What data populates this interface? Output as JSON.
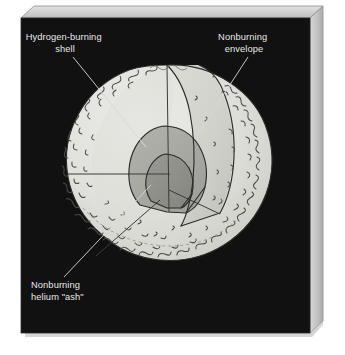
{
  "figure": {
    "background_color": "#ffffff",
    "panel_color": "#111111",
    "bevel_color": "#c9c9c9",
    "bevel_shadow_color": "#9a9a9a",
    "label_color": "#e8e8e8",
    "leader_color": "#d8d8d8"
  },
  "labels": [
    {
      "id": "hydrogen-burning-shell",
      "lines": [
        "Hydrogen-burning",
        "shell"
      ],
      "align": "middle",
      "x": 65,
      "y": 40
    },
    {
      "id": "nonburning-envelope",
      "lines": [
        "Nonburning",
        "envelope"
      ],
      "align": "middle",
      "x": 244,
      "y": 40
    },
    {
      "id": "nonburning-helium-ash",
      "lines": [
        "Nonburning",
        "helium \"ash\""
      ],
      "align": "start",
      "x": 31,
      "y": 288
    }
  ],
  "regions": [
    {
      "id": "envelope",
      "name": "Nonburning envelope",
      "color": "#dededa"
    },
    {
      "id": "cut-face",
      "name": "Cutaway interior face",
      "color": "#d2d2cc"
    },
    {
      "id": "shell",
      "name": "Hydrogen-burning shell",
      "color": "#a9a9a4"
    },
    {
      "id": "core",
      "name": "Nonburning helium ash core",
      "color": "#8f8f8a"
    }
  ],
  "sphere": {
    "center_x": 167,
    "center_y": 170,
    "radius": 105
  }
}
